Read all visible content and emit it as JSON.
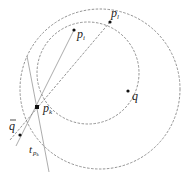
{
  "diagram": {
    "type": "geometry",
    "points": [
      {
        "id": "p_k",
        "label": "p",
        "sub": "k",
        "x": 37,
        "y": 107
      },
      {
        "id": "p_i",
        "label": "p",
        "sub": "i",
        "x": 74,
        "y": 30
      },
      {
        "id": "p_l",
        "label": "p",
        "sub": "l",
        "x": 110,
        "y": 22
      },
      {
        "id": "q",
        "label": "q",
        "x": 128,
        "y": 91
      },
      {
        "id": "q_bar",
        "label": "q",
        "overbar": true,
        "x": 20,
        "y": 135
      }
    ],
    "circles": [
      {
        "id": "circle-small",
        "cx": 88,
        "cy": 73,
        "r": 51,
        "style": "dashed"
      },
      {
        "id": "circle-large",
        "cx": 100,
        "cy": 89,
        "r": 80,
        "style": "dashed"
      }
    ],
    "lines": [
      {
        "id": "line-pi-pk",
        "style": "solid",
        "x1": 74,
        "y1": 30,
        "x2": 16,
        "y2": 146
      },
      {
        "id": "tangent-t-pk",
        "style": "solid",
        "x1": 27,
        "y1": 56,
        "x2": 49,
        "y2": 172
      },
      {
        "id": "line-pl-qbar",
        "style": "dashed",
        "x1": 110,
        "y1": 22,
        "x2": 10,
        "y2": 140
      }
    ],
    "labels": {
      "p_k": {
        "main": "p",
        "sub": "k"
      },
      "p_i": {
        "main": "p",
        "sub": "i"
      },
      "p_l": {
        "main": "p",
        "sub": "l"
      },
      "q": {
        "main": "q"
      },
      "q_bar": {
        "main": "q"
      },
      "tangent": {
        "main": "t",
        "sub": "p",
        "subsub": "k"
      }
    }
  }
}
